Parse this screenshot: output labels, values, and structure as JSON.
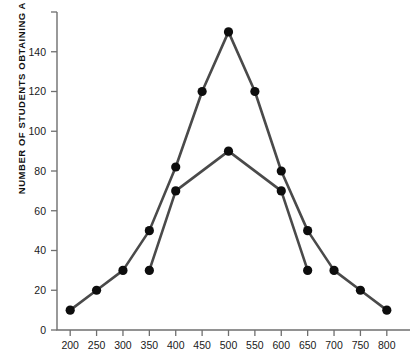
{
  "chart_data": {
    "type": "line",
    "title": "",
    "xlabel": "",
    "ylabel": "NUMBER OF STUDENTS OBTAINING A SCORE",
    "xlim": [
      175,
      825
    ],
    "ylim": [
      0,
      160
    ],
    "grid": false,
    "legend": "none",
    "x_ticks": [
      200,
      250,
      300,
      350,
      400,
      450,
      500,
      550,
      600,
      650,
      700,
      750,
      800
    ],
    "x_tick_labels": [
      "200",
      "250",
      "300",
      "350",
      "400",
      "450",
      "500",
      "550",
      "600",
      "650",
      "700",
      "750",
      "800"
    ],
    "y_ticks": [
      0,
      20,
      40,
      60,
      80,
      100,
      120,
      140,
      160
    ],
    "y_tick_labels": [
      "0",
      "20",
      "40",
      "60",
      "80",
      "100",
      "120",
      "140",
      ""
    ],
    "series": [
      {
        "name": "broad-distribution",
        "x": [
          200,
          250,
          300,
          350,
          400,
          450,
          500,
          550,
          600,
          650,
          700,
          750,
          800
        ],
        "values": [
          10,
          20,
          30,
          50,
          82,
          120,
          150,
          120,
          80,
          50,
          30,
          20,
          10
        ],
        "marker": "filled-circle",
        "color": "#4a4a4a"
      },
      {
        "name": "narrow-distribution",
        "x": [
          350,
          400,
          500,
          600,
          650
        ],
        "values": [
          30,
          70,
          90,
          70,
          30
        ],
        "marker": "filled-circle",
        "color": "#4a4a4a"
      }
    ]
  },
  "colors": {
    "line": "#4a4a4a",
    "marker": "#0d0d0d",
    "axis": "#6f6f6f",
    "text": "#1a1a1a",
    "background": "#ffffff"
  }
}
